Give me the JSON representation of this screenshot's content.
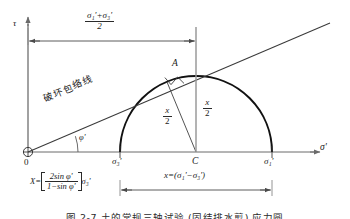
{
  "figure": {
    "type": "mohr-circle-diagram",
    "caption": "图 2-7   土的常规三轴试验 (固结排水剪) 应力圆",
    "axes": {
      "y_label": "τ",
      "x_label": "σ'",
      "origin_label": "0"
    },
    "labels": {
      "top_fraction_num": "σ₁'+σ₃'",
      "top_fraction_den": "2",
      "envelope_text": "破坏包络线",
      "friction_angle": "φ'",
      "tangent_point": "A",
      "center_point": "C",
      "sigma3": "σ₃'",
      "sigma1": "σ₁'",
      "radius_num": "x",
      "radius_den": "2",
      "height_num": "x",
      "height_den": "2",
      "bottom_right": "x=(σ₁'−σ₃')",
      "formula_lhs": "X=",
      "formula_num": "2sin φ'",
      "formula_den": "1−sin φ'",
      "formula_tail": "σ₃'"
    },
    "colors": {
      "line": "#2a2a2a",
      "axis": "#6a6a6a",
      "circle": "#1a1a1a",
      "background": "#ffffff"
    },
    "geometry": {
      "origin": [
        28,
        152
      ],
      "sigma3_x": 120,
      "sigma1_x": 272,
      "center_x": 196,
      "radius": 76,
      "tangent_point": [
        167,
        75
      ]
    }
  }
}
